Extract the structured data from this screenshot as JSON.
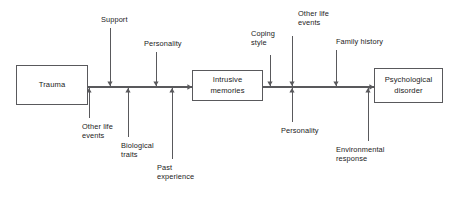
{
  "diagram": {
    "type": "flow-diagram",
    "title": "",
    "canvas": {
      "width": 459,
      "height": 197,
      "background": "#ffffff"
    },
    "line_color": "#59595c",
    "text_color": "#1b1b1b",
    "nodes": [
      {
        "id": "trauma",
        "label": "Trauma",
        "x": 16,
        "y": 65,
        "w": 72,
        "h": 40
      },
      {
        "id": "intrusive-memories",
        "label": "Intrusive\nmemories",
        "x": 192,
        "y": 70,
        "w": 71,
        "h": 31
      },
      {
        "id": "psychological-disorder",
        "label": "Psychological\ndisorder",
        "x": 374,
        "y": 68,
        "w": 69,
        "h": 35
      }
    ],
    "factors": [
      {
        "id": "support",
        "label": "Support",
        "direction": "down",
        "x": 110,
        "label_x": 101,
        "label_y": 15,
        "line_top": 28,
        "line_bottom": 86
      },
      {
        "id": "personality-1",
        "label": "Personality",
        "direction": "down",
        "x": 156,
        "label_x": 144,
        "label_y": 39,
        "line_top": 52,
        "line_bottom": 86
      },
      {
        "id": "other-life-events-1",
        "label": "Other life\nevents",
        "direction": "up",
        "x": 89,
        "label_x": 82,
        "label_y": 122,
        "line_top": 88,
        "line_bottom": 118
      },
      {
        "id": "biological-traits",
        "label": "Biological\ntraits",
        "direction": "up",
        "x": 128,
        "label_x": 121,
        "label_y": 141,
        "line_top": 88,
        "line_bottom": 137
      },
      {
        "id": "past-experience",
        "label": "Past\nexperience",
        "direction": "up",
        "x": 172,
        "label_x": 157,
        "label_y": 163,
        "line_top": 88,
        "line_bottom": 159
      },
      {
        "id": "coping-style",
        "label": "Coping\nstyle",
        "direction": "down",
        "x": 270,
        "label_x": 251,
        "label_y": 29,
        "line_top": 55,
        "line_bottom": 86
      },
      {
        "id": "other-life-events-2",
        "label": "Other life\nevents",
        "direction": "down",
        "x": 292,
        "label_x": 298,
        "label_y": 9,
        "line_top": 36,
        "line_bottom": 86
      },
      {
        "id": "family-history",
        "label": "Family history",
        "direction": "down",
        "x": 336,
        "label_x": 336,
        "label_y": 37,
        "line_top": 50,
        "line_bottom": 86
      },
      {
        "id": "personality-2",
        "label": "Personality",
        "direction": "up",
        "x": 292,
        "label_x": 281,
        "label_y": 126,
        "line_top": 88,
        "line_bottom": 122
      },
      {
        "id": "environmental-response",
        "label": "Environmental\nresponse",
        "direction": "up",
        "x": 368,
        "label_x": 336,
        "label_y": 145,
        "line_top": 88,
        "line_bottom": 141
      }
    ],
    "main_flow": [
      {
        "id": "trauma-to-intrusive",
        "from": "trauma",
        "to": "intrusive-memories",
        "x1": 88,
        "x2": 192,
        "y": 87
      },
      {
        "id": "intrusive-to-disorder",
        "from": "intrusive-memories",
        "to": "psychological-disorder",
        "x1": 263,
        "x2": 374,
        "y": 87
      }
    ]
  }
}
